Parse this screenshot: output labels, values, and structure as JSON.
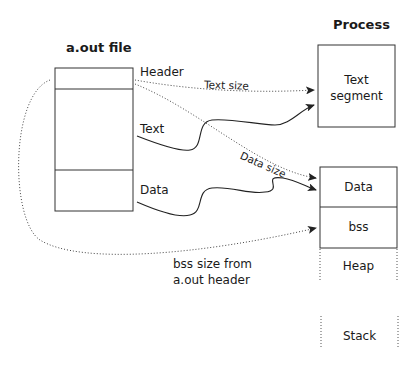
{
  "diagram": {
    "file": {
      "title": "a.out file",
      "sections": [
        "Header",
        "Text",
        "Data"
      ]
    },
    "process": {
      "title": "Process",
      "segments": {
        "text": [
          "Text",
          "segment"
        ],
        "data": "Data",
        "bss": "bss",
        "heap": "Heap",
        "stack": "Stack"
      }
    },
    "arrows": {
      "text_size": "Text size",
      "data_size": "Data size",
      "bss_size": [
        "bss size from",
        "a.out header"
      ]
    }
  }
}
